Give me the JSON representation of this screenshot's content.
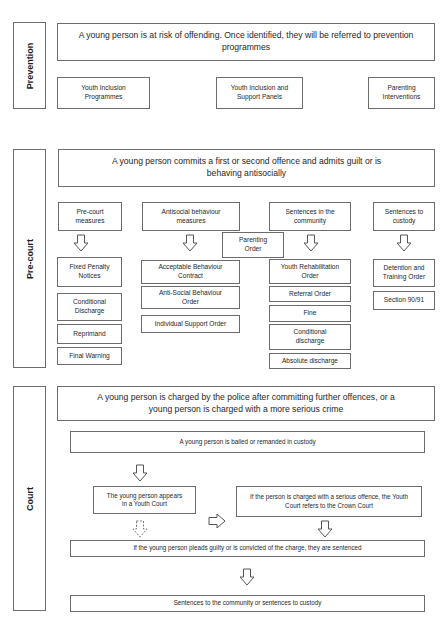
{
  "sections": {
    "prevention": {
      "label": "Prevention",
      "main": "A young person is at risk of offending. Once identified, they will be referred to prevention programmes",
      "items": [
        "Youth Inclusion Programmes",
        "Youth Inclusion and Support Panels",
        "Parenting Interventions"
      ]
    },
    "precourt": {
      "label": "Pre-court",
      "main": "A young person commits a first or second offence and admits guilt or is behaving antisocially",
      "parenting_order": "Parenting Order",
      "columns": [
        {
          "header": "Pre-court measures",
          "items": [
            "Fixed Penalty Notices",
            "Conditional Discharge",
            "Reprimand",
            "Final Warning"
          ]
        },
        {
          "header": "Antisocial behaviour measures",
          "items": [
            "Acceptable Behaviour Contract",
            "Anti-Social Behaviour Order",
            "Individual Support Order"
          ]
        },
        {
          "header": "Sentences in the community",
          "items": [
            "Youth Rehabilitation Order",
            "Referral Order",
            "Fine",
            "Conditional discharge",
            "Absolute discharge"
          ]
        },
        {
          "header": "Sentences to custody",
          "items": [
            "Detention and Training Order",
            "Section 90/91"
          ]
        }
      ]
    },
    "court": {
      "label": "Court",
      "main": "A young person is charged by the police after committing further offences, or a young person is charged with a more serious crime",
      "bailed": "A young person is bailed or remanded in custody",
      "youth_court": "The young person appears in a Youth Court",
      "crown_court": "If the person is charged with a serious offence, the Youth Court refers to the Crown Court",
      "sentenced": "If the young person pleads guilty or is convicted of the charge, they are sentenced",
      "final": "Sentences to the community or sentences to custody"
    }
  }
}
